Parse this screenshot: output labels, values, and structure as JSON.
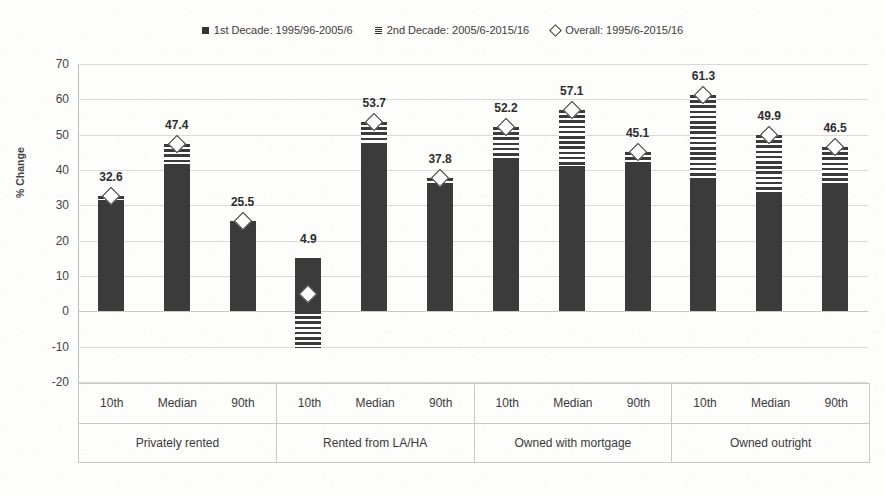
{
  "chart_data": {
    "type": "bar",
    "title": "",
    "xlabel": "",
    "ylabel": "% Change",
    "ylim": [
      -20,
      70
    ],
    "ytick_step": 10,
    "yticks": [
      "70",
      "60",
      "50",
      "40",
      "30",
      "20",
      "10",
      "0",
      "-10",
      "-20"
    ],
    "grid": true,
    "legend_position": "top-center",
    "stacked": true,
    "legend": [
      {
        "label": "1st Decade: 1995/96-2005/6",
        "marker": "filled-square",
        "color": "#3b3b3b"
      },
      {
        "label": "2nd Decade: 2005/6-2015/16",
        "marker": "hatched-square",
        "color": "#3b3b3b"
      },
      {
        "label": "Overall: 1995/6-2015/16",
        "marker": "hollow-diamond",
        "color": "#3b3b3b"
      }
    ],
    "groups": [
      {
        "name": "Privately rented",
        "ticks": [
          "10th",
          "Median",
          "90th"
        ]
      },
      {
        "name": "Rented from LA/HA",
        "ticks": [
          "10th",
          "Median",
          "90th"
        ]
      },
      {
        "name": "Owned with mortgage",
        "ticks": [
          "10th",
          "Median",
          "90th"
        ]
      },
      {
        "name": "Owned outright",
        "ticks": [
          "10th",
          "Median",
          "90th"
        ]
      }
    ],
    "categories": [
      "Privately rented 10th",
      "Privately rented Median",
      "Privately rented 90th",
      "Rented from LA/HA 10th",
      "Rented from LA/HA Median",
      "Rented from LA/HA 90th",
      "Owned with mortgage 10th",
      "Owned with mortgage Median",
      "Owned with mortgage 90th",
      "Owned outright 10th",
      "Owned outright Median",
      "Owned outright 90th"
    ],
    "series": [
      {
        "name": "1st Decade: 1995/96-2005/6",
        "values": [
          31.4,
          41.8,
          25.0,
          15.2,
          47.3,
          35.6,
          43.3,
          41.0,
          42.0,
          37.8,
          33.8,
          36.3
        ]
      },
      {
        "name": "2nd Decade: 2005/6-2015/16",
        "values": [
          1.2,
          5.6,
          0.5,
          -10.3,
          6.4,
          2.2,
          8.9,
          16.1,
          3.1,
          23.5,
          16.1,
          10.2
        ]
      },
      {
        "name": "Overall: 1995/6-2015/16",
        "values": [
          32.6,
          47.4,
          25.5,
          4.9,
          53.7,
          37.8,
          52.2,
          57.1,
          45.1,
          61.3,
          49.9,
          46.5
        ]
      }
    ],
    "data_labels": [
      "32.6",
      "47.4",
      "25.5",
      "4.9",
      "53.7",
      "37.8",
      "52.2",
      "57.1",
      "45.1",
      "61.3",
      "49.9",
      "46.5"
    ]
  }
}
